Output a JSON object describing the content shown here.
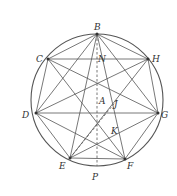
{
  "diagram": {
    "points": [
      {
        "id": "B",
        "label": "B"
      },
      {
        "id": "C",
        "label": "C"
      },
      {
        "id": "H",
        "label": "H"
      },
      {
        "id": "D",
        "label": "D"
      },
      {
        "id": "G",
        "label": "G"
      },
      {
        "id": "E",
        "label": "E"
      },
      {
        "id": "F",
        "label": "F"
      },
      {
        "id": "P",
        "label": "P"
      },
      {
        "id": "A",
        "label": "A"
      },
      {
        "id": "J",
        "label": "J"
      },
      {
        "id": "K",
        "label": "K"
      },
      {
        "id": "N",
        "label": "N"
      }
    ],
    "polygon_vertices": [
      "B",
      "H",
      "G",
      "F",
      "E",
      "D",
      "C"
    ],
    "solid_segments": [
      [
        "B",
        "H"
      ],
      [
        "H",
        "G"
      ],
      [
        "G",
        "F"
      ],
      [
        "F",
        "E"
      ],
      [
        "E",
        "D"
      ],
      [
        "D",
        "C"
      ],
      [
        "C",
        "B"
      ],
      [
        "C",
        "H"
      ],
      [
        "D",
        "G"
      ],
      [
        "B",
        "E"
      ],
      [
        "B",
        "F"
      ],
      [
        "C",
        "G"
      ],
      [
        "C",
        "F"
      ],
      [
        "H",
        "D"
      ],
      [
        "H",
        "E"
      ],
      [
        "D",
        "F"
      ],
      [
        "G",
        "E"
      ],
      [
        "B",
        "D"
      ],
      [
        "B",
        "G"
      ]
    ],
    "dashed_segments": [
      [
        "B",
        "P"
      ],
      [
        "E",
        "J"
      ]
    ]
  }
}
